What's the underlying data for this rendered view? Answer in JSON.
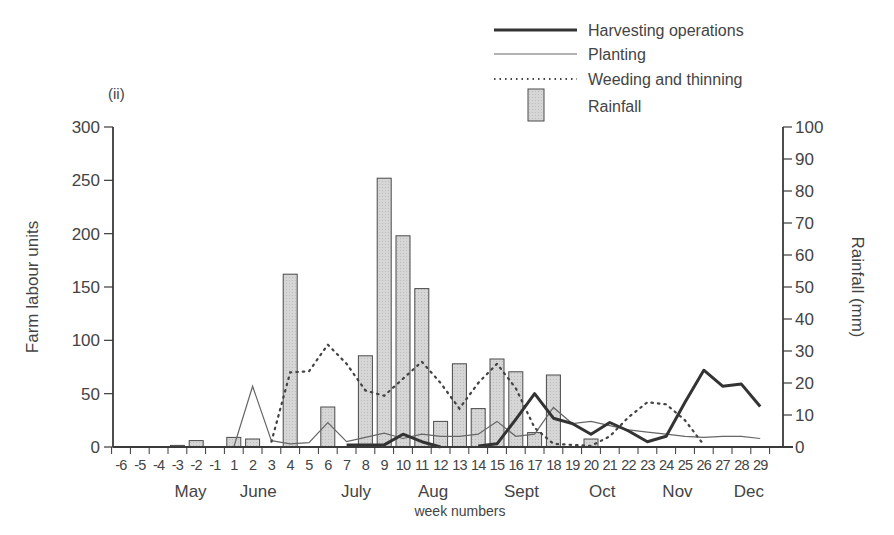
{
  "panel_label": "(ii)",
  "legend": [
    {
      "label": "Harvesting operations",
      "style": "thick-solid"
    },
    {
      "label": "Planting",
      "style": "thin-solid"
    },
    {
      "label": "Weeding and thinning",
      "style": "dotted"
    },
    {
      "label": "Rainfall",
      "style": "bar"
    }
  ],
  "axes": {
    "left_label": "Farm labour units",
    "right_label": "Rainfall (mm)",
    "x_label": "week numbers",
    "left_ticks": [
      "0",
      "50",
      "100",
      "150",
      "200",
      "250",
      "300"
    ],
    "right_ticks": [
      "0",
      "10",
      "20",
      "30",
      "40",
      "50",
      "60",
      "70",
      "80",
      "90",
      "100"
    ],
    "months": [
      {
        "label": "May",
        "week": -2.3
      },
      {
        "label": "June",
        "week": 2.3
      },
      {
        "label": "July",
        "week": 7.5
      },
      {
        "label": "Aug",
        "week": 11.6
      },
      {
        "label": "Sept",
        "week": 16.3
      },
      {
        "label": "Oct",
        "week": 20.6
      },
      {
        "label": "Nov",
        "week": 24.6
      },
      {
        "label": "Dec",
        "week": 28.4
      }
    ]
  },
  "colors": {
    "axis": "#3a3a3a",
    "bar_fill": "#d4d4d4",
    "bar_stroke": "#4a4a4a",
    "harvest": "#333333",
    "planting": "#666666",
    "weeding": "#444444"
  },
  "chart_data": {
    "type": "bar+line",
    "title": "(ii)",
    "xlabel": "week numbers",
    "ylabel": "Farm labour units",
    "y2label": "Rainfall (mm)",
    "ylim": [
      0,
      300
    ],
    "y2lim": [
      0,
      100
    ],
    "x": [
      -6,
      -5,
      -4,
      -3,
      -2,
      -1,
      1,
      2,
      3,
      4,
      5,
      6,
      7,
      8,
      9,
      10,
      11,
      12,
      13,
      14,
      15,
      16,
      17,
      18,
      19,
      20,
      21,
      22,
      23,
      24,
      25,
      26,
      27,
      28,
      29
    ],
    "month_labels": [
      "May",
      "June",
      "July",
      "Aug",
      "Sept",
      "Oct",
      "Nov",
      "Dec"
    ],
    "legend_position": "top-right",
    "grid": false,
    "series": [
      {
        "name": "Rainfall",
        "type": "bar",
        "axis": "right",
        "unit": "mm",
        "points": [
          {
            "week": -3,
            "value": 0.5
          },
          {
            "week": -2,
            "value": 2
          },
          {
            "week": 1,
            "value": 3
          },
          {
            "week": 2,
            "value": 2.5
          },
          {
            "week": 4,
            "value": 54
          },
          {
            "week": 6,
            "value": 12.5
          },
          {
            "week": 8,
            "value": 28.5
          },
          {
            "week": 9,
            "value": 84
          },
          {
            "week": 10,
            "value": 66
          },
          {
            "week": 11,
            "value": 49.5
          },
          {
            "week": 12,
            "value": 8
          },
          {
            "week": 13,
            "value": 26
          },
          {
            "week": 14,
            "value": 12
          },
          {
            "week": 15,
            "value": 27.5
          },
          {
            "week": 16,
            "value": 23.5
          },
          {
            "week": 17,
            "value": 4.5
          },
          {
            "week": 18,
            "value": 22.5
          },
          {
            "week": 20,
            "value": 2.5
          }
        ]
      },
      {
        "name": "Harvesting operations",
        "type": "line",
        "style": "thick",
        "axis": "left",
        "points": [
          {
            "week": 7,
            "value": 2
          },
          {
            "week": 8,
            "value": 2
          },
          {
            "week": 9,
            "value": 2
          },
          {
            "week": 10,
            "value": 12
          },
          {
            "week": 11,
            "value": 5
          },
          {
            "week": 12,
            "value": 0
          },
          {
            "week": 14,
            "value": 1
          },
          {
            "week": 15,
            "value": 3
          },
          {
            "week": 16,
            "value": 26
          },
          {
            "week": 17,
            "value": 50
          },
          {
            "week": 18,
            "value": 27
          },
          {
            "week": 19,
            "value": 22
          },
          {
            "week": 20,
            "value": 12
          },
          {
            "week": 21,
            "value": 23
          },
          {
            "week": 22,
            "value": 15
          },
          {
            "week": 23,
            "value": 5
          },
          {
            "week": 24,
            "value": 10
          },
          {
            "week": 25,
            "value": 42
          },
          {
            "week": 26,
            "value": 72
          },
          {
            "week": 27,
            "value": 57
          },
          {
            "week": 28,
            "value": 59
          },
          {
            "week": 29,
            "value": 38
          }
        ]
      },
      {
        "name": "Planting",
        "type": "line",
        "style": "thin",
        "axis": "left",
        "points": [
          {
            "week": 1,
            "value": 0
          },
          {
            "week": 2,
            "value": 57
          },
          {
            "week": 3,
            "value": 6
          },
          {
            "week": 4,
            "value": 3
          },
          {
            "week": 5,
            "value": 4
          },
          {
            "week": 6,
            "value": 23
          },
          {
            "week": 7,
            "value": 5
          },
          {
            "week": 8,
            "value": 9
          },
          {
            "week": 9,
            "value": 13
          },
          {
            "week": 10,
            "value": 8
          },
          {
            "week": 11,
            "value": 12
          },
          {
            "week": 12,
            "value": 10
          },
          {
            "week": 13,
            "value": 10
          },
          {
            "week": 14,
            "value": 12
          },
          {
            "week": 15,
            "value": 24
          },
          {
            "week": 16,
            "value": 10
          },
          {
            "week": 17,
            "value": 12
          },
          {
            "week": 18,
            "value": 37
          },
          {
            "week": 19,
            "value": 22
          },
          {
            "week": 20,
            "value": 24
          },
          {
            "week": 21,
            "value": 20
          },
          {
            "week": 22,
            "value": 16
          },
          {
            "week": 23,
            "value": 14
          },
          {
            "week": 24,
            "value": 12
          },
          {
            "week": 25,
            "value": 10
          },
          {
            "week": 26,
            "value": 9
          },
          {
            "week": 27,
            "value": 10
          },
          {
            "week": 28,
            "value": 10
          },
          {
            "week": 29,
            "value": 8
          }
        ]
      },
      {
        "name": "Weeding and thinning",
        "type": "line",
        "style": "dotted",
        "axis": "left",
        "points": [
          {
            "week": 3,
            "value": 5
          },
          {
            "week": 4,
            "value": 70
          },
          {
            "week": 5,
            "value": 71
          },
          {
            "week": 6,
            "value": 96
          },
          {
            "week": 7,
            "value": 78
          },
          {
            "week": 8,
            "value": 53
          },
          {
            "week": 9,
            "value": 48
          },
          {
            "week": 10,
            "value": 64
          },
          {
            "week": 11,
            "value": 80
          },
          {
            "week": 12,
            "value": 60
          },
          {
            "week": 13,
            "value": 36
          },
          {
            "week": 14,
            "value": 60
          },
          {
            "week": 15,
            "value": 78
          },
          {
            "week": 16,
            "value": 55
          },
          {
            "week": 17,
            "value": 18
          },
          {
            "week": 18,
            "value": 3
          },
          {
            "week": 19,
            "value": 2
          },
          {
            "week": 20,
            "value": 1
          },
          {
            "week": 21,
            "value": 10
          },
          {
            "week": 22,
            "value": 28
          },
          {
            "week": 23,
            "value": 42
          },
          {
            "week": 24,
            "value": 40
          },
          {
            "week": 25,
            "value": 25
          },
          {
            "week": 26,
            "value": 2
          }
        ]
      }
    ]
  }
}
